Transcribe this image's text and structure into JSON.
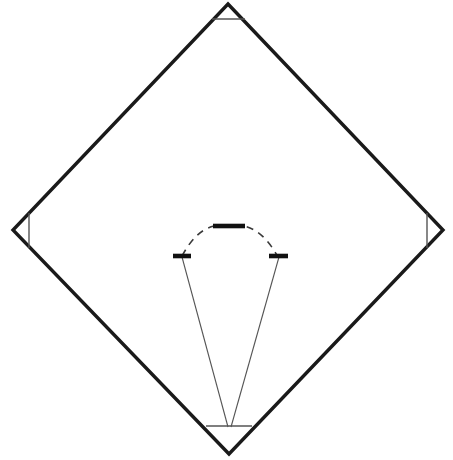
{
  "diagram": {
    "title": "Baseball Infield Diamond Diagram",
    "type": "line-drawing",
    "canvas": {
      "width": 453,
      "height": 460,
      "background": "#ffffff"
    },
    "colors": {
      "baseline": "#1a1a1a",
      "base_marker": "#111111",
      "thin_line": "#555555",
      "dashed_arc": "#3a3a3a",
      "background": "#ffffff"
    },
    "geometry": {
      "diamond": {
        "label": "Base path diamond",
        "stroke_width": 3.4,
        "vertices": [
          {
            "name": "second-base",
            "x": 228,
            "y": 4
          },
          {
            "name": "first-base",
            "x": 443,
            "y": 230
          },
          {
            "name": "home-plate",
            "x": 229,
            "y": 454
          },
          {
            "name": "third-base",
            "x": 13,
            "y": 230
          }
        ]
      },
      "base_cutoff_lines": [
        {
          "name": "second-base-line",
          "x1": 212,
          "y1": 19,
          "x2": 245,
          "y2": 19,
          "stroke_width": 1.4
        },
        {
          "name": "third-base-line",
          "x1": 29,
          "y1": 213,
          "x2": 29,
          "y2": 248,
          "stroke_width": 1.4
        },
        {
          "name": "first-base-line",
          "x1": 427,
          "y1": 213,
          "x2": 427,
          "y2": 248,
          "stroke_width": 1.4
        },
        {
          "name": "home-plate-line",
          "x1": 206,
          "y1": 426,
          "x2": 252,
          "y2": 426,
          "stroke_width": 1.4
        }
      ],
      "pitching_arc": {
        "label": "Dashed pitching arc",
        "stroke_width": 1.6,
        "dash_pattern": "7 6",
        "path": "M 182 256 Q 196 230 214 226 L 244 226 Q 263 230 278 257"
      },
      "arc_markers": [
        {
          "name": "pitching-rubber",
          "x1": 213,
          "y1": 226,
          "x2": 245,
          "y2": 226,
          "stroke_width": 4.6
        },
        {
          "name": "left-arc-marker",
          "x1": 173,
          "y1": 256,
          "x2": 191,
          "y2": 256,
          "stroke_width": 4.6
        },
        {
          "name": "right-arc-marker",
          "x1": 269,
          "y1": 256,
          "x2": 288,
          "y2": 256,
          "stroke_width": 4.6
        }
      ],
      "foul_lines": [
        {
          "name": "left-foul-line",
          "x1": 182,
          "y1": 257,
          "x2": 228,
          "y2": 427,
          "stroke_width": 1.1
        },
        {
          "name": "right-foul-line",
          "x1": 279,
          "y1": 257,
          "x2": 231,
          "y2": 427,
          "stroke_width": 1.1
        }
      ]
    }
  }
}
